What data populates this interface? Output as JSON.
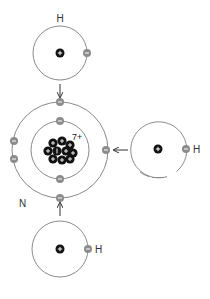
{
  "diagram": {
    "title": "",
    "colors": {
      "orbit": "#8a8a8a",
      "nucleus": "#111111",
      "electron": "#8c8c8c",
      "arrow": "#333333",
      "text": "#333333"
    },
    "labels": {
      "top_h": "H",
      "right_h": "H",
      "bottom_h": "H",
      "nitrogen": "N",
      "nitrogen_charge": "7+"
    },
    "symbols": {
      "proton": "+",
      "electron": "−"
    },
    "atoms": [
      {
        "name": "hydrogen-top",
        "element": "H",
        "electrons": 1,
        "protons": 1
      },
      {
        "name": "nitrogen",
        "element": "N",
        "electrons_inner": 2,
        "electrons_outer": 5,
        "protons": 7
      },
      {
        "name": "hydrogen-right",
        "element": "H",
        "electrons": 1,
        "protons": 1
      },
      {
        "name": "hydrogen-bottom",
        "element": "H",
        "electrons": 1,
        "protons": 1
      }
    ]
  }
}
